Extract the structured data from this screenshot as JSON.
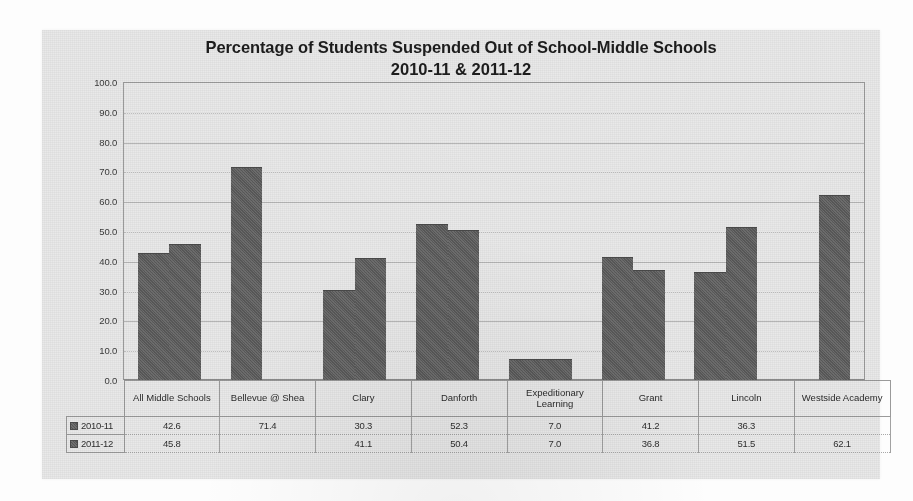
{
  "chart_data": {
    "type": "bar",
    "title": "Percentage of Students Suspended Out of School-Middle Schools",
    "subtitle": "2010-11 & 2011-12",
    "xlabel": "",
    "ylabel": "",
    "ylim": [
      0,
      100
    ],
    "ytick_step": 10,
    "ytick_labels": [
      "100.0",
      "90.0",
      "80.0",
      "70.0",
      "60.0",
      "50.0",
      "40.0",
      "30.0",
      "20.0",
      "10.0",
      "0.0"
    ],
    "grid": true,
    "legend_position": "table-left",
    "bar_color": "#5e5e5e",
    "plot_background": "#e9e9e9",
    "categories": [
      "All Middle Schools",
      "Bellevue @ Shea",
      "Clary",
      "Danforth",
      "Expeditionary Learning",
      "Grant",
      "Lincoln",
      "Westside Academy"
    ],
    "series": [
      {
        "name": "2010-11",
        "values": [
          42.6,
          71.4,
          30.3,
          52.3,
          7.0,
          41.2,
          36.3,
          null
        ],
        "labels": [
          "42.6",
          "71.4",
          "30.3",
          "52.3",
          "7.0",
          "41.2",
          "36.3",
          ""
        ]
      },
      {
        "name": "2011-12",
        "values": [
          45.8,
          null,
          41.1,
          50.4,
          7.0,
          36.8,
          51.5,
          62.1
        ],
        "labels": [
          "45.8",
          "",
          "41.1",
          "50.4",
          "7.0",
          "36.8",
          "51.5",
          "62.1"
        ]
      }
    ]
  },
  "table": {
    "category_headers": [
      "All Middle Schools",
      "Bellevue @ Shea",
      "Clary",
      "Danforth",
      "Expeditionary Learning",
      "Grant",
      "Lincoln",
      "Westside Academy"
    ],
    "rows": [
      {
        "label": "2010-11",
        "values": [
          "42.6",
          "71.4",
          "30.3",
          "52.3",
          "7.0",
          "41.2",
          "36.3",
          ""
        ]
      },
      {
        "label": "2011-12",
        "values": [
          "45.8",
          "",
          "41.1",
          "50.4",
          "7.0",
          "36.8",
          "51.5",
          "62.1"
        ]
      }
    ]
  }
}
